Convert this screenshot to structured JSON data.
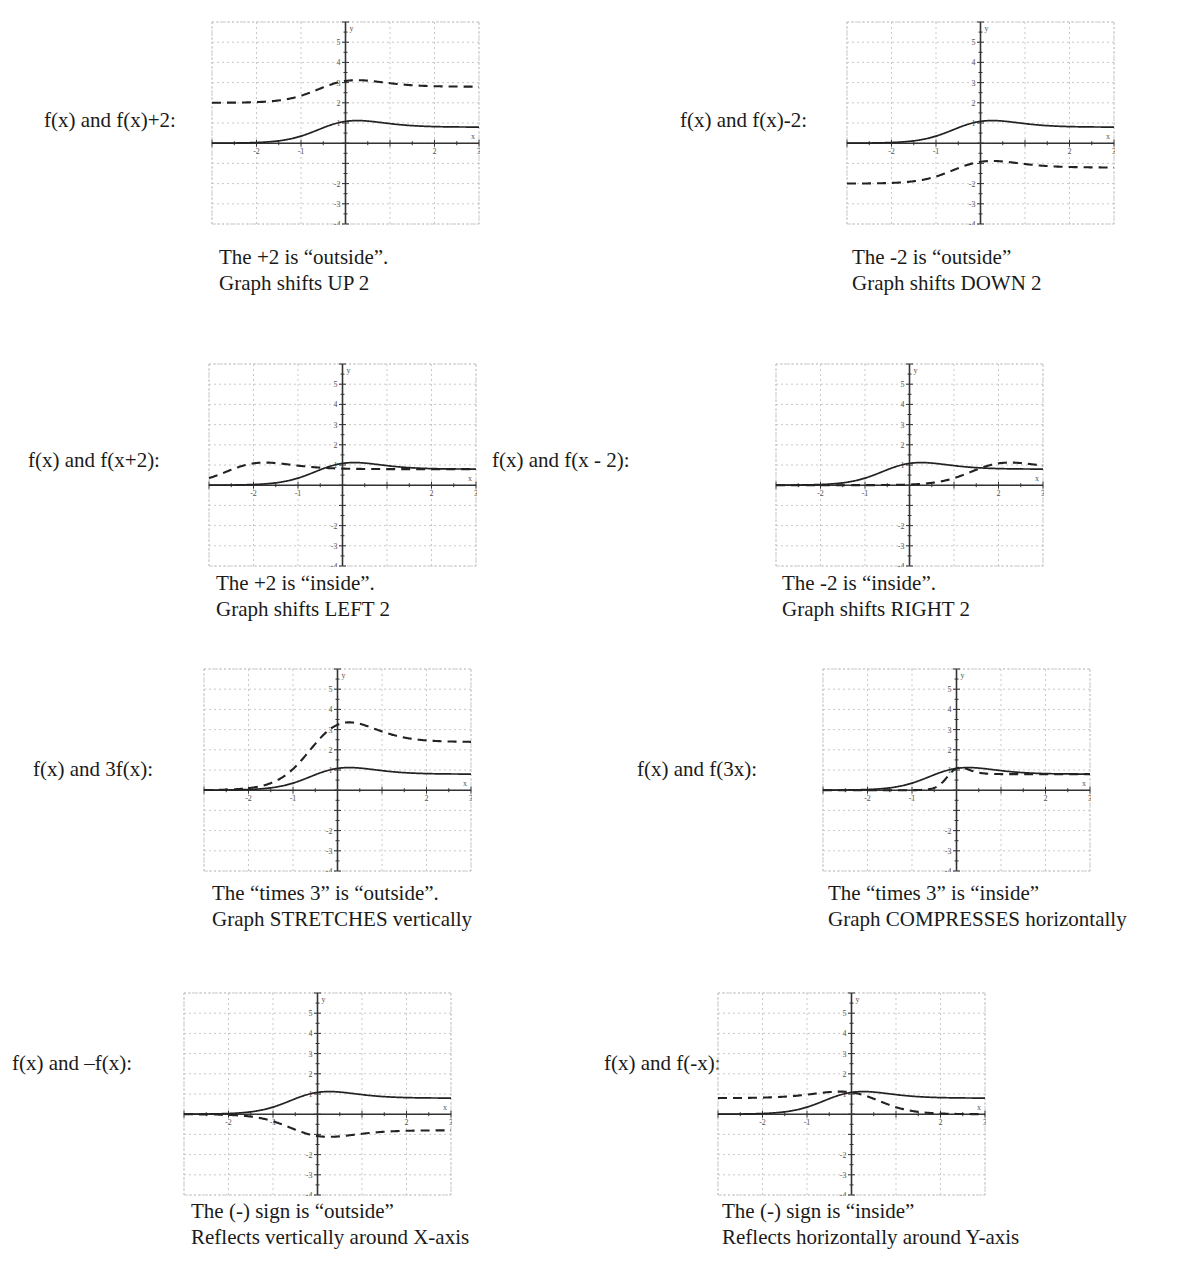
{
  "document": {
    "type": "function-transformation-worksheet",
    "background_color": "#ffffff",
    "text_color": "#1a1a1a",
    "curve_color": "#222222"
  },
  "grid": {
    "x_ticks": [
      "-2",
      "-1",
      "1",
      "2",
      "3"
    ],
    "y_ticks_positive": [
      "5",
      "4",
      "3",
      "2",
      "1"
    ],
    "y_ticks_negative": [
      "-2",
      "-3",
      "-4"
    ],
    "x_axis_label": "x",
    "y_axis_label": "y",
    "xlim": [
      -3,
      3
    ],
    "ylim": [
      -4,
      6
    ]
  },
  "chart_data": {
    "type": "line",
    "xlabel": "x",
    "ylabel": "y",
    "xlim": [
      -3,
      3
    ],
    "ylim": [
      -4,
      6
    ],
    "grid": true,
    "legend": "none",
    "base_function": {
      "name": "f(x)",
      "style": "solid",
      "description": "logistic-like bump peaking near y=1.5 at x=0, approaching 0 to the left and ~0.8 to the right",
      "x": [
        -3,
        -2.5,
        -2,
        -1.5,
        -1,
        -0.5,
        0,
        0.5,
        1,
        1.5,
        2,
        2.5,
        3
      ],
      "y": [
        0.02,
        0.05,
        0.12,
        0.38,
        0.75,
        1.25,
        1.5,
        1.42,
        1.15,
        0.95,
        0.85,
        0.82,
        0.8
      ]
    },
    "panels": [
      {
        "id": "fx-plus-2",
        "label": "f(x) and f(x)+2:",
        "transform": "f(x) + 2",
        "dashed_series": {
          "name": "f(x)+2",
          "style": "dashed",
          "x": [
            -3,
            -2.5,
            -2,
            -1.5,
            -1,
            -0.5,
            0,
            0.5,
            1,
            1.5,
            2,
            2.5,
            3
          ],
          "y": [
            2.02,
            2.05,
            2.12,
            2.38,
            2.75,
            3.25,
            3.5,
            3.42,
            3.15,
            2.95,
            2.85,
            2.82,
            2.8
          ]
        },
        "caption_line1": "The +2 is “outside”.",
        "caption_line2": "Graph shifts UP 2"
      },
      {
        "id": "fx-minus-2",
        "label": "f(x) and f(x)-2:",
        "transform": "f(x) - 2",
        "dashed_series": {
          "name": "f(x)-2",
          "style": "dashed",
          "x": [
            -3,
            -2.5,
            -2,
            -1.5,
            -1,
            -0.5,
            0,
            0.5,
            1,
            1.5,
            2,
            2.5,
            3
          ],
          "y": [
            -1.98,
            -1.95,
            -1.88,
            -1.62,
            -1.25,
            -0.75,
            -0.5,
            -0.58,
            -0.85,
            -1.05,
            -1.15,
            -1.18,
            -1.2
          ]
        },
        "caption_line1": "The -2 is “outside”",
        "caption_line2": "Graph shifts DOWN 2"
      },
      {
        "id": "fx-plus-2-inside",
        "label": "f(x) and f(x+2):",
        "transform": "f(x + 2)",
        "dashed_series": {
          "name": "f(x+2)",
          "style": "dashed",
          "x": [
            -3,
            -2.5,
            -2,
            -1.5,
            -1,
            -0.5,
            0,
            0.5,
            1,
            1.5,
            2,
            2.5,
            3
          ],
          "y": [
            0.75,
            1.25,
            1.5,
            1.42,
            1.15,
            0.95,
            0.85,
            0.82,
            0.8,
            0.8,
            0.8,
            0.8,
            0.8
          ]
        },
        "caption_line1": "The +2 is “inside”.",
        "caption_line2": "Graph shifts LEFT 2"
      },
      {
        "id": "fx-minus-2-inside",
        "label": "f(x) and f(x - 2):",
        "transform": "f(x - 2)",
        "dashed_series": {
          "name": "f(x-2)",
          "style": "dashed",
          "x": [
            -3,
            -2.5,
            -2,
            -1.5,
            -1,
            -0.5,
            0,
            0.5,
            1,
            1.5,
            2,
            2.5,
            3
          ],
          "y": [
            0.0,
            0.0,
            0.02,
            0.05,
            0.12,
            0.38,
            0.75,
            1.25,
            1.5,
            1.42,
            1.15,
            0.95,
            0.85
          ]
        },
        "caption_line1": "The -2 is “inside”.",
        "caption_line2": "Graph shifts RIGHT 2"
      },
      {
        "id": "three-fx",
        "label": "f(x) and 3f(x):",
        "transform": "3 f(x)",
        "dashed_series": {
          "name": "3f(x)",
          "style": "dashed",
          "x": [
            -3,
            -2.5,
            -2,
            -1.5,
            -1,
            -0.5,
            0,
            0.5,
            1,
            1.5,
            2,
            2.5,
            3
          ],
          "y": [
            0.06,
            0.15,
            0.36,
            1.14,
            2.25,
            3.75,
            4.5,
            4.26,
            3.45,
            2.85,
            2.55,
            2.46,
            2.4
          ]
        },
        "caption_line1": "The “times 3” is “outside”.",
        "caption_line2": "Graph STRETCHES vertically"
      },
      {
        "id": "f-three-x",
        "label": "f(x) and f(3x):",
        "transform": "f(3x)",
        "dashed_series": {
          "name": "f(3x)",
          "style": "dashed",
          "x": [
            -3,
            -2.5,
            -2,
            -1.5,
            -1,
            -0.5,
            0,
            0.5,
            1,
            1.5,
            2,
            2.5,
            3
          ],
          "y": [
            0.0,
            0.0,
            0.0,
            0.01,
            0.02,
            0.12,
            1.5,
            1.15,
            0.85,
            0.82,
            0.8,
            0.8,
            0.8
          ]
        },
        "caption_line1": "The “times 3” is “inside”",
        "caption_line2": "Graph COMPRESSES horizontally"
      },
      {
        "id": "neg-fx",
        "label": "f(x) and –f(x):",
        "transform": "-f(x)",
        "dashed_series": {
          "name": "-f(x)",
          "style": "dashed",
          "x": [
            -3,
            -2.5,
            -2,
            -1.5,
            -1,
            -0.5,
            0,
            0.5,
            1,
            1.5,
            2,
            2.5,
            3
          ],
          "y": [
            -0.02,
            -0.05,
            -0.12,
            -0.38,
            -0.75,
            -1.25,
            -1.5,
            -1.42,
            -1.15,
            -0.95,
            -0.85,
            -0.82,
            -0.8
          ]
        },
        "caption_line1": "The (-) sign is “outside”",
        "caption_line2": "Reflects vertically around X-axis"
      },
      {
        "id": "f-neg-x",
        "label": "f(x) and f(-x):",
        "transform": "f(-x)",
        "dashed_series": {
          "name": "f(-x)",
          "style": "dashed",
          "x": [
            -3,
            -2.5,
            -2,
            -1.5,
            -1,
            -0.5,
            0,
            0.5,
            1,
            1.5,
            2,
            2.5,
            3
          ],
          "y": [
            0.8,
            0.82,
            0.85,
            0.95,
            1.15,
            1.42,
            1.5,
            1.25,
            0.75,
            0.38,
            0.12,
            0.05,
            0.02
          ]
        },
        "caption_line1": "The (-) sign is “inside”",
        "caption_line2": "Reflects horizontally around Y-axis"
      }
    ]
  }
}
